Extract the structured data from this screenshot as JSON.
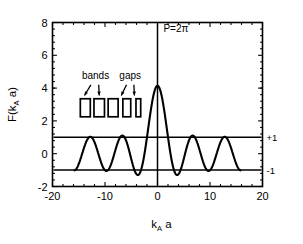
{
  "chart_data": {
    "type": "line",
    "title": "",
    "xlabel": "k_A a",
    "xlabel_main": "k",
    "xlabel_sub": "A",
    "xlabel_tail": " a",
    "ylabel": "F(k_A a)",
    "ylabel_main": "F(k",
    "ylabel_sub": "A",
    "ylabel_tail": " a)",
    "xlim": [
      -20,
      20
    ],
    "ylim": [
      -2,
      8
    ],
    "xticks": [
      -20,
      -10,
      0,
      10,
      20
    ],
    "xtick_labels": [
      "-20",
      "-10",
      "0",
      "10",
      "20"
    ],
    "yticks": [
      -2,
      0,
      2,
      4,
      6,
      8
    ],
    "ytick_labels": [
      "-2",
      "0",
      "2",
      "4",
      "6",
      "8"
    ],
    "grid": false,
    "legend": "none",
    "minor_ticks_x": 5,
    "minor_ticks_y": 5,
    "series": [
      {
        "name": "F(k_A a)",
        "kind": "curve",
        "description": "Kronig-Penney dispersion function: oscillatory with central peak near k=0 reaching 7.2, side lobes oscillating between about -1.8 and +1.3, amplitude decaying toward +/-1.1 at large |k|",
        "x_range": [
          -15.8,
          15.8
        ],
        "peak_value": 7.2,
        "peak_x": 0,
        "samples_x": [
          -15.8,
          -15.0,
          -14.2,
          -13.5,
          -12.7,
          -11.9,
          -11.1,
          -10.3,
          -9.5,
          -8.8,
          -8.0,
          -7.2,
          -6.4,
          -5.6,
          -4.8,
          -4.1,
          -3.3,
          -2.5,
          -1.7,
          -0.9,
          -0.4,
          0.0,
          0.4,
          0.9,
          1.7,
          2.5,
          3.3,
          4.1,
          4.8,
          5.6,
          6.4,
          7.2,
          8.0,
          8.8,
          9.5,
          10.3,
          11.1,
          11.9,
          12.7,
          13.5,
          14.2,
          15.0,
          15.8
        ],
        "samples_y": [
          -0.95,
          0.1,
          1.05,
          0.55,
          -0.7,
          -1.1,
          -0.35,
          0.8,
          1.1,
          0.15,
          -1.0,
          -1.2,
          0.1,
          1.15,
          0.0,
          -1.75,
          -0.5,
          2.2,
          5.4,
          7.0,
          7.2,
          7.2,
          7.2,
          7.0,
          5.4,
          2.2,
          -0.5,
          -1.75,
          0.0,
          1.15,
          0.1,
          -1.2,
          -1.0,
          0.15,
          1.1,
          0.8,
          -0.35,
          -1.1,
          -0.7,
          0.55,
          1.05,
          0.1,
          -0.95
        ]
      },
      {
        "name": "+1 level",
        "kind": "hline",
        "value": 1,
        "label": "+1"
      },
      {
        "name": "-1 level",
        "kind": "hline",
        "value": -1,
        "label": "-1"
      },
      {
        "name": "vertical axis at zero",
        "kind": "vline",
        "value": 0
      }
    ],
    "annotations": [
      {
        "text": "P=2π",
        "x": 3.5,
        "y": 7.4,
        "name": "p-value-annotation"
      },
      {
        "text": "bands",
        "x": -11.8,
        "y": 4.55,
        "name": "bands-annotation"
      },
      {
        "text": "gaps",
        "x": -5.2,
        "y": 4.55,
        "name": "gaps-annotation"
      }
    ],
    "band_boxes": [
      {
        "x_left": -14.7,
        "x_right": -12.8,
        "y_bottom": 2.25,
        "y_top": 3.35
      },
      {
        "x_left": -12.1,
        "x_right": -10.1,
        "y_bottom": 2.25,
        "y_top": 3.35
      },
      {
        "x_left": -9.4,
        "x_right": -7.5,
        "y_bottom": 2.25,
        "y_top": 3.35
      },
      {
        "x_left": -6.6,
        "x_right": -5.1,
        "y_bottom": 2.25,
        "y_top": 3.35
      },
      {
        "x_left": -4.1,
        "x_right": -3.2,
        "y_bottom": 2.25,
        "y_top": 3.35
      }
    ],
    "arrows": [
      {
        "from_x": -12.7,
        "from_y": 4.2,
        "to_x": -13.9,
        "to_y": 3.55,
        "group": "bands"
      },
      {
        "from_x": -11.2,
        "from_y": 4.2,
        "to_x": -11.1,
        "to_y": 3.55,
        "group": "bands"
      },
      {
        "from_x": -5.9,
        "from_y": 4.2,
        "to_x": -6.9,
        "to_y": 3.55,
        "group": "gaps"
      },
      {
        "from_x": -4.5,
        "from_y": 4.2,
        "to_x": -4.4,
        "to_y": 3.55,
        "group": "gaps"
      }
    ],
    "level_labels": [
      {
        "text": "+1",
        "value": 1
      },
      {
        "text": "-1",
        "value": -1
      }
    ]
  },
  "colors": {
    "curve": "#000000",
    "axis": "#000000",
    "background": "#ffffff",
    "box_stroke": "#000000"
  }
}
